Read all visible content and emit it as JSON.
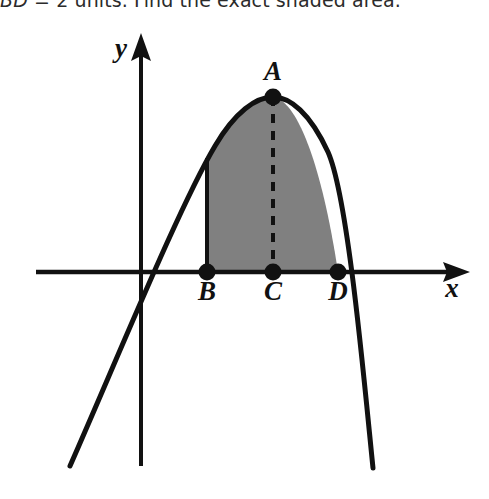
{
  "question": {
    "text_truncated": "BD = 2 units. Find the exact shaded area.",
    "prefix_italic": "BD",
    "rest": " = 2 units. Find the exact shaded area."
  },
  "figure": {
    "type": "coordinate-diagram",
    "axes": {
      "x_label": "x",
      "y_label": "y",
      "x_axis": {
        "x_start": 36,
        "x_end": 470,
        "y": 272,
        "arrow": "right"
      },
      "y_axis": {
        "x": 141,
        "y_start": 34,
        "y_end": 466,
        "arrow": "up"
      }
    },
    "points": [
      {
        "name": "A",
        "label": "A",
        "cx": 273,
        "cy": 97,
        "label_x": 273,
        "label_y": 80,
        "role": "vertex-of-parabola"
      },
      {
        "name": "B",
        "label": "B",
        "cx": 207,
        "cy": 272,
        "label_x": 207,
        "label_y": 300,
        "role": "left-bound-on-x-axis"
      },
      {
        "name": "C",
        "label": "C",
        "cx": 273,
        "cy": 272,
        "label_x": 273,
        "label_y": 300,
        "role": "foot-of-vertex-on-x-axis"
      },
      {
        "name": "D",
        "label": "D",
        "cx": 338,
        "cy": 272,
        "label_x": 338,
        "label_y": 300,
        "role": "right-root-on-x-axis"
      }
    ],
    "parabola": {
      "vertex_x": 273,
      "vertex_y": 97,
      "left_root_x": 147,
      "right_root_x": 338,
      "left_end": {
        "x": 70,
        "y": 466
      },
      "right_end": {
        "x": 373,
        "y": 468
      }
    },
    "shaded_region": {
      "fill_color": "#808080",
      "left_boundary_x": 207,
      "right_boundary_x": 338,
      "bottom_y": 272
    },
    "dashed_segment": {
      "from": "A",
      "to": "C",
      "x": 273,
      "y_top": 97,
      "y_bottom": 272
    },
    "solid_vertical_segment": {
      "from": "B",
      "x": 207,
      "y_top": 158,
      "y_bottom": 272
    },
    "colors": {
      "stroke": "#111111",
      "shade": "#808080",
      "background": "#ffffff"
    }
  }
}
